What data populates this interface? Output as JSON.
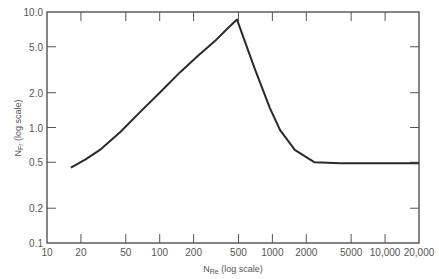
{
  "chart_data": {
    "type": "line",
    "title": "",
    "xlabel": "N_Re (log scale)",
    "ylabel": "N_Fr (log scale)",
    "xlabel_main": "N",
    "xlabel_sub": "Re",
    "xlabel_suffix": " (log scale)",
    "ylabel_main": "N",
    "ylabel_sub": "Fr",
    "ylabel_suffix": " (log scale)",
    "x_scale": "log",
    "y_scale": "log",
    "xlim": [
      10,
      20000
    ],
    "ylim": [
      0.1,
      10.0
    ],
    "grid": false,
    "legend": null,
    "x_ticks": [
      10,
      20,
      50,
      100,
      200,
      500,
      1000,
      2000,
      5000,
      10000,
      20000
    ],
    "x_tick_labels": [
      "10",
      "20",
      "50",
      "100",
      "200",
      "500",
      "1000",
      "2000",
      "5000",
      "10,000",
      "20,000"
    ],
    "y_ticks": [
      0.1,
      0.2,
      0.5,
      1.0,
      2.0,
      5.0,
      10.0
    ],
    "y_tick_labels": [
      "0.1",
      "0.2",
      "0.5",
      "1.0",
      "2.0",
      "5.0",
      "10.0"
    ],
    "series": [
      {
        "name": "N_Fr vs N_Re",
        "x": [
          16.3,
          22,
          29.5,
          45,
          66.9,
          100,
          151,
          220,
          309,
          400,
          485,
          700,
          950,
          1170,
          1580,
          2370,
          4000,
          10000,
          20000
        ],
        "y": [
          0.45,
          0.53,
          0.64,
          0.92,
          1.36,
          2.0,
          3.0,
          4.2,
          5.6,
          7.2,
          8.6,
          3.2,
          1.47,
          0.95,
          0.64,
          0.5,
          0.49,
          0.49,
          0.49
        ]
      }
    ]
  }
}
